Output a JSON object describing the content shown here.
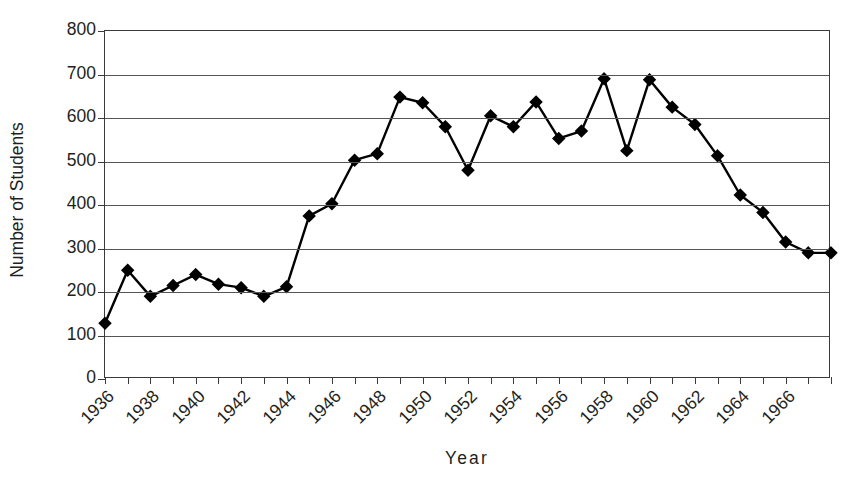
{
  "chart_data": {
    "type": "line",
    "title": "",
    "xlabel": "Year",
    "ylabel": "Number of Students",
    "ylim": [
      0,
      800
    ],
    "ytick_labels": [
      "800",
      "700",
      "600",
      "500",
      "400",
      "300",
      "200",
      "100",
      "0"
    ],
    "ytick_values": [
      800,
      700,
      600,
      500,
      400,
      300,
      200,
      100,
      0
    ],
    "xlim": [
      1936,
      1968
    ],
    "xtick_labels": [
      "1936",
      "1938",
      "1940",
      "1942",
      "1944",
      "1946",
      "1948",
      "1950",
      "1952",
      "1954",
      "1956",
      "1958",
      "1960",
      "1962",
      "1964",
      "1966"
    ],
    "xtick_values": [
      1936,
      1938,
      1940,
      1942,
      1944,
      1946,
      1948,
      1950,
      1952,
      1954,
      1956,
      1958,
      1960,
      1962,
      1964,
      1966
    ],
    "xtick_rotation": -45,
    "grid": "horizontal",
    "legend": "none",
    "marker": "diamond",
    "marker_color": "#000000",
    "line_color": "#000000",
    "x": [
      1936,
      1937,
      1938,
      1939,
      1940,
      1941,
      1942,
      1943,
      1944,
      1945,
      1946,
      1947,
      1948,
      1949,
      1950,
      1951,
      1952,
      1953,
      1954,
      1955,
      1956,
      1957,
      1958,
      1959,
      1960,
      1961,
      1962,
      1963,
      1964,
      1965,
      1966,
      1967,
      1968
    ],
    "values": [
      128,
      250,
      190,
      215,
      240,
      218,
      210,
      190,
      212,
      375,
      403,
      503,
      518,
      648,
      635,
      580,
      480,
      605,
      580,
      637,
      553,
      570,
      690,
      525,
      688,
      625,
      585,
      513,
      423,
      383,
      315,
      290,
      290
    ],
    "series": [
      {
        "name": "Number of Students",
        "values": [
          128,
          250,
          190,
          215,
          240,
          218,
          210,
          190,
          212,
          375,
          403,
          503,
          518,
          648,
          635,
          580,
          480,
          605,
          580,
          637,
          553,
          570,
          690,
          525,
          688,
          625,
          585,
          513,
          423,
          383,
          315,
          290,
          290
        ]
      }
    ]
  }
}
